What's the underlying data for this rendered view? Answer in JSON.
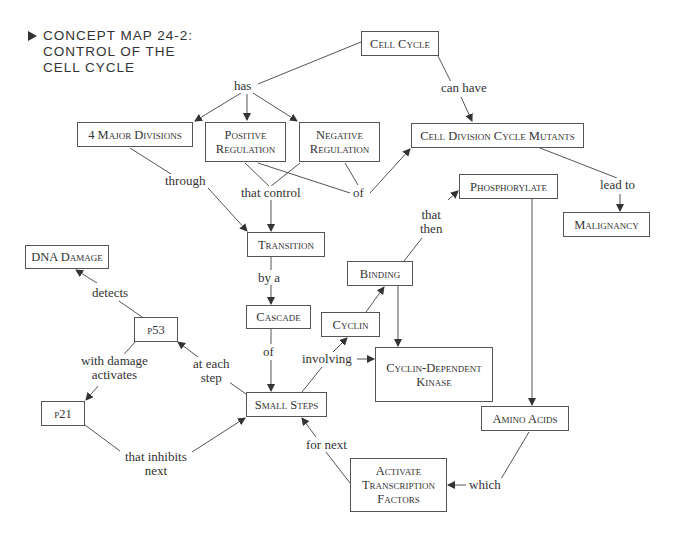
{
  "title": {
    "marker": "triangle-bullet",
    "lines": [
      "CONCEPT MAP 24-2:",
      "CONTROL OF THE",
      "CELL CYCLE"
    ]
  },
  "nodes": {
    "cell_cycle": "Cell Cycle",
    "major_divisions": "4 Major Divisions",
    "positive_regulation": "Positive Regulation",
    "negative_regulation": "Negative Regulation",
    "cdc_mutants": "Cell Division Cycle Mutants",
    "phosphorylate": "Phosphorylate",
    "malignancy": "Malignancy",
    "transition": "Transition",
    "dna_damage": "DNA Damage",
    "binding": "Binding",
    "cascade": "Cascade",
    "cyclin": "Cyclin",
    "p53": "p53",
    "cdk": "Cyclin-Dependent Kinase",
    "small_steps": "Small Steps",
    "amino_acids": "Amino Acids",
    "p21": "p21",
    "activate_tf": "Activate Transcription Factors"
  },
  "links": {
    "has": "has",
    "can_have": "can have",
    "through": "through",
    "that_control": "that control",
    "of_1": "of",
    "lead_to": "lead to",
    "that_then": "that\nthen",
    "by_a": "by a",
    "detects": "detects",
    "of_2": "of",
    "involving": "involving",
    "with_damage_activates": "with damage\nactivates",
    "at_each_step": "at each\nstep",
    "that_inhibits_next": "that inhibits\nnext",
    "for_next": "for next",
    "which": "which"
  },
  "colors": {
    "line": "#555555",
    "text": "#333333",
    "background": "#ffffff"
  }
}
